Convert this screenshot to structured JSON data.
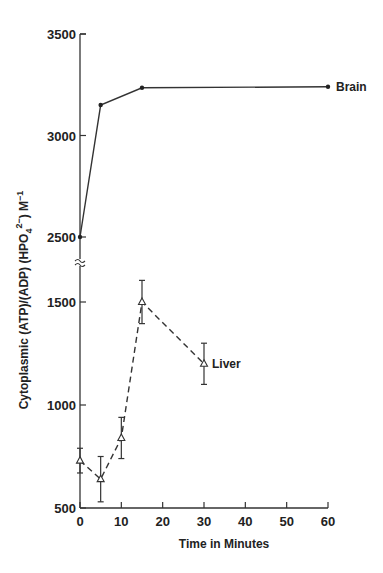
{
  "chart_data": {
    "type": "line",
    "title": "",
    "xlabel": "Time in Minutes",
    "ylabel": "Cytoplasmic (ATP)/(ADP)(HPO4 2-) M-1",
    "ylabel_parts": {
      "main": "Cytoplasmic (ATP)/(ADP) (HPO",
      "sub": "4",
      "sup": "2−",
      "close": ")",
      "unit": " M",
      "unit_sup": "−1"
    },
    "x_ticks": [
      0,
      10,
      20,
      30,
      40,
      50,
      60
    ],
    "xlim": [
      0,
      60
    ],
    "y_axis_broken": true,
    "y_ticks_upper": [
      2500,
      3000,
      3500
    ],
    "y_ticks_lower": [
      500,
      1000,
      1500
    ],
    "ylim_upper": [
      2500,
      3500
    ],
    "ylim_lower": [
      500,
      1600
    ],
    "grid": false,
    "legend": "inline labels",
    "series": [
      {
        "name": "Brain",
        "marker": "filled-circle",
        "line": "solid",
        "x": [
          0,
          5,
          15,
          60
        ],
        "values": [
          2500,
          3150,
          3235,
          3240
        ]
      },
      {
        "name": "Liver",
        "marker": "open-triangle",
        "line": "dashed",
        "x": [
          0,
          5,
          10,
          15,
          30
        ],
        "values": [
          730,
          640,
          840,
          1500,
          1200
        ],
        "error": [
          60,
          110,
          100,
          105,
          100
        ]
      }
    ]
  }
}
